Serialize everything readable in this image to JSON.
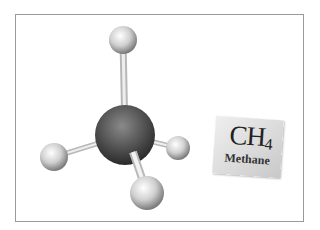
{
  "diagram": {
    "formula": {
      "base": "CH",
      "subscript": "4"
    },
    "name": "Methane",
    "atoms": [
      {
        "id": "C",
        "element": "carbon",
        "cx": 125,
        "cy": 135,
        "r": 30,
        "color": "#555555"
      },
      {
        "id": "H1",
        "element": "hydrogen",
        "cx": 123,
        "cy": 40,
        "r": 14,
        "color": "#d8d8d8"
      },
      {
        "id": "H2",
        "element": "hydrogen",
        "cx": 54,
        "cy": 157,
        "r": 14,
        "color": "#d8d8d8"
      },
      {
        "id": "H3",
        "element": "hydrogen",
        "cx": 178,
        "cy": 148,
        "r": 12,
        "color": "#d8d8d8"
      },
      {
        "id": "H4",
        "element": "hydrogen",
        "cx": 147,
        "cy": 193,
        "r": 17,
        "color": "#d8d8d8"
      }
    ],
    "bonds": [
      {
        "from": "C",
        "to": "H1"
      },
      {
        "from": "C",
        "to": "H2"
      },
      {
        "from": "C",
        "to": "H3"
      },
      {
        "from": "C",
        "to": "H4"
      }
    ]
  }
}
